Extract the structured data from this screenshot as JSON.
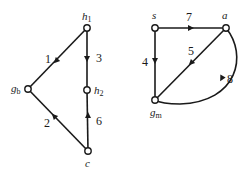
{
  "diagram": {
    "type": "directed-graph",
    "graphs": [
      {
        "id": "left",
        "nodes": [
          {
            "id": "h1",
            "label": "h",
            "sub": "1",
            "x": 87,
            "y": 28
          },
          {
            "id": "gb",
            "label": "g",
            "sub": "b",
            "x": 28,
            "y": 89
          },
          {
            "id": "h2",
            "label": "h",
            "sub": "2",
            "x": 87,
            "y": 90
          },
          {
            "id": "c",
            "label": "c",
            "sub": "",
            "x": 88,
            "y": 151
          }
        ],
        "edges": [
          {
            "from": "h1",
            "to": "gb",
            "label": "1"
          },
          {
            "from": "c",
            "to": "gb",
            "label": "2"
          },
          {
            "from": "h1",
            "to": "h2",
            "label": "3"
          },
          {
            "from": "c",
            "to": "h2",
            "label": "6"
          }
        ]
      },
      {
        "id": "right",
        "nodes": [
          {
            "id": "s",
            "label": "s",
            "sub": "",
            "x": 155,
            "y": 28
          },
          {
            "id": "a",
            "label": "a",
            "sub": "",
            "x": 226,
            "y": 28
          },
          {
            "id": "gm",
            "label": "g",
            "sub": "m",
            "x": 155,
            "y": 100
          }
        ],
        "edges": [
          {
            "from": "s",
            "to": "a",
            "label": "7"
          },
          {
            "from": "s",
            "to": "gm",
            "label": "4"
          },
          {
            "from": "a",
            "to": "gm",
            "label": "5"
          },
          {
            "from": "a",
            "to": "gm",
            "label": "8",
            "curved": true
          }
        ]
      }
    ]
  },
  "labels": {
    "h1": "h",
    "h1_sub": "1",
    "gb": "g",
    "gb_sub": "b",
    "h2": "h",
    "h2_sub": "2",
    "c": "c",
    "s": "s",
    "a": "a",
    "gm": "g",
    "gm_sub": "m",
    "e1": "1",
    "e2": "2",
    "e3": "3",
    "e4": "4",
    "e5": "5",
    "e6": "6",
    "e7": "7",
    "e8": "8"
  }
}
